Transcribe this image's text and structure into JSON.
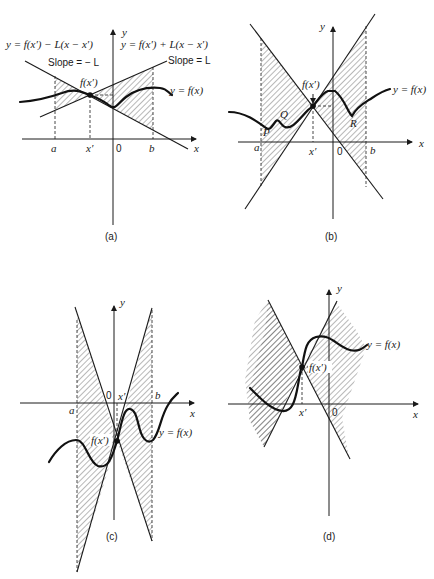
{
  "figure": {
    "panels": [
      {
        "id": "a",
        "caption": "(a)",
        "axis_labels": {
          "x": "x",
          "y": "y"
        },
        "tick_labels": {
          "a": "a",
          "xprime": "x′",
          "origin": "0",
          "b": "b"
        },
        "equations": {
          "lower_line": "y = f(x′) − L(x − x′)",
          "upper_line": "y = f(x′) + L(x − x′)"
        },
        "slope_labels": {
          "negative": "Slope = − L",
          "positive": "Slope = L"
        },
        "point_label": "f(x′)",
        "curve_label": "y = f(x)"
      },
      {
        "id": "b",
        "caption": "(b)",
        "axis_labels": {
          "x": "x",
          "y": "y"
        },
        "tick_labels": {
          "a": "a",
          "xprime": "x′",
          "origin": "0",
          "b": "b"
        },
        "point_label": "f(x′)",
        "curve_label": "y = f(x)",
        "region_labels": {
          "P": "P",
          "Q": "Q",
          "R": "R"
        }
      },
      {
        "id": "c",
        "caption": "(c)",
        "axis_labels": {
          "x": "x",
          "y": "y"
        },
        "tick_labels": {
          "a": "a",
          "xprime": "x′",
          "origin": "0",
          "b": "b"
        },
        "point_label": "f(x′)",
        "curve_label": "y = f(x)"
      },
      {
        "id": "d",
        "caption": "(d)",
        "axis_labels": {
          "x": "x",
          "y": "y"
        },
        "tick_labels": {
          "xprime": "x′",
          "origin": "0"
        },
        "point_label": "f(x′)",
        "curve_label": "y = f(x)"
      }
    ]
  }
}
